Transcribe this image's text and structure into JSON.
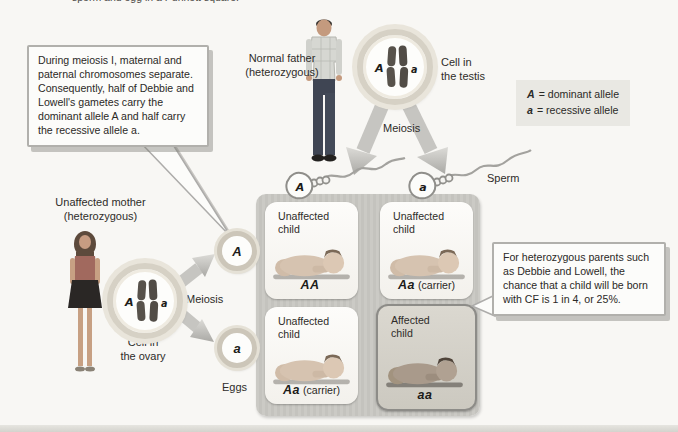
{
  "page": {
    "caption_fragment": "sperm and egg in a Punnett square."
  },
  "legend": {
    "items": [
      {
        "symbol": "A",
        "text": "= dominant allele"
      },
      {
        "symbol": "a",
        "text": "= recessive allele"
      }
    ]
  },
  "callouts": {
    "meiosis_note": "During meiosis I, maternal and paternal chromosomes separate. Consequently, half of Debbie and Lowell's gametes carry the dominant allele A and half carry the recessive allele a.",
    "probability_note": "For heterozygous parents such as Debbie and Lowell, the chance that a child will be born with CF is 1 in 4, or 25%."
  },
  "father": {
    "label": "Normal father",
    "label_sub": "(heterozygous)",
    "cell_label_1": "Cell in",
    "cell_label_2": "the testis",
    "meiosis_label": "Meiosis"
  },
  "mother": {
    "label": "Unaffected mother",
    "label_sub": "(heterozygous)",
    "cell_label_1": "Cell in",
    "cell_label_2": "the ovary",
    "meiosis_label": "Meiosis"
  },
  "gametes": {
    "sperm_label": "Sperm",
    "eggs_label": "Eggs",
    "sperm_alleles": [
      "A",
      "a"
    ],
    "egg_alleles": [
      "A",
      "a"
    ],
    "cell_alleles": {
      "dominant": "A",
      "recessive": "a"
    }
  },
  "punnett": {
    "cells": [
      {
        "status": "Unaffected child",
        "genotype": "AA",
        "note": ""
      },
      {
        "status": "Unaffected child",
        "genotype": "Aa",
        "note": "(carrier)"
      },
      {
        "status": "Unaffected child",
        "genotype": "Aa",
        "note": "(carrier)"
      },
      {
        "status": "Affected child",
        "genotype": "aa",
        "note": ""
      }
    ]
  },
  "colors": {
    "punnett_grid": "#c9c8c3",
    "affected_cell": "#d3d0c8",
    "callout_border": "#b1b0ac",
    "legend_bg": "#e9e8e3"
  }
}
